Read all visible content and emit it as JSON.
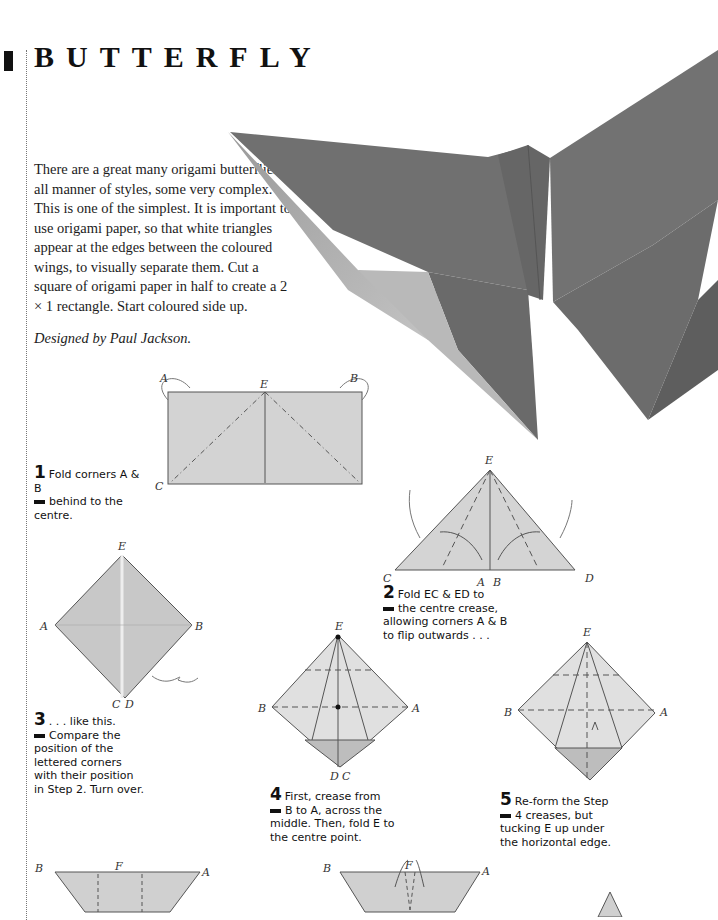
{
  "page": {
    "title": "BUTTERFLY",
    "intro": "There are a great many origami butterflies in all manner of styles, some very complex. This is one of the simplest. It is important to use origami paper, so that white triangles appear at the edges between the coloured wings, to visually separate them. Cut a square of origami paper in half to create a 2 × 1 rectangle. Start coloured side up.",
    "credit": "Designed by Paul Jackson."
  },
  "colors": {
    "paper_coloured": "#6e6e6e",
    "paper_light": "#c9c9c9",
    "diagram_fill": "#d2d2d2",
    "text": "#1a1a1a"
  },
  "steps": [
    {
      "num": "1",
      "text_first": "Fold corners A & B",
      "text_rest": "behind to the centre."
    },
    {
      "num": "2",
      "text_first": "Fold EC & ED to",
      "text_rest": "the centre crease, allowing corners A & B to flip outwards . . ."
    },
    {
      "num": "3",
      "text_first": ". . . like this.",
      "text_rest": "Compare the position of the lettered corners with their position in Step 2. Turn over."
    },
    {
      "num": "4",
      "text_first": "First, crease from",
      "text_rest": "B to A, across the middle. Then, fold E to the centre point."
    },
    {
      "num": "5",
      "text_first": "Re-form the Step",
      "text_rest": "4 creases, but tucking E up under the horizontal edge."
    }
  ],
  "diagram_labels": {
    "d1": {
      "a": "A",
      "b": "B",
      "c": "C",
      "d": "D",
      "e": "E"
    },
    "d2": {
      "a": "A",
      "b": "B",
      "c": "C",
      "d": "D",
      "e": "E"
    },
    "d3": {
      "a": "A",
      "b": "B",
      "c": "C",
      "d": "D",
      "e": "E"
    },
    "d4": {
      "a": "A",
      "b": "B",
      "c": "C",
      "d": "D",
      "e": "E"
    },
    "d5": {
      "a": "A",
      "b": "B",
      "c": "C",
      "d": "D",
      "e": "E"
    },
    "d6": {
      "a": "A",
      "b": "B",
      "f": "F"
    },
    "d7": {
      "a": "A",
      "b": "B",
      "f": "F"
    }
  }
}
